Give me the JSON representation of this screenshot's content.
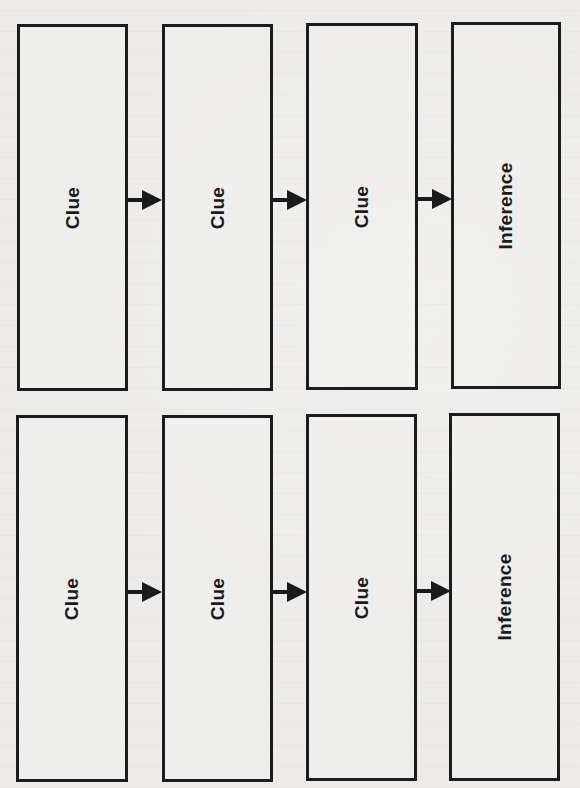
{
  "diagram": {
    "title": "",
    "type": "clue-to-inference flow",
    "rows": [
      {
        "boxes": [
          {
            "label": "Clue"
          },
          {
            "label": "Clue"
          },
          {
            "label": "Clue"
          },
          {
            "label": "Inference"
          }
        ]
      },
      {
        "boxes": [
          {
            "label": "Clue"
          },
          {
            "label": "Clue"
          },
          {
            "label": "Clue"
          },
          {
            "label": "Inference"
          }
        ]
      }
    ],
    "colors": {
      "border": "#1c1c1c",
      "background": "#ecebe9",
      "text": "#1a1a1a"
    }
  }
}
